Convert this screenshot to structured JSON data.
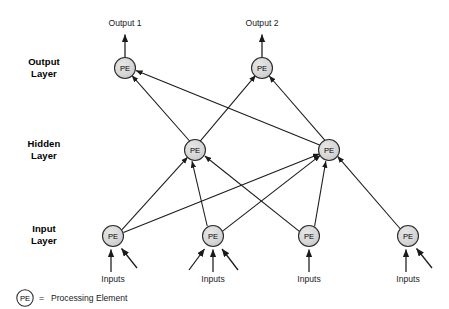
{
  "diagram": {
    "node_label": "PE",
    "colors": {
      "node_fill": "#d4d4d4",
      "node_stroke": "#2b2b2b",
      "edge": "#1a1a1a",
      "text": "#000000",
      "background": "#ffffff"
    }
  },
  "layer_labels": [
    {
      "id": "output",
      "line1": "Output",
      "line2": "Layer"
    },
    {
      "id": "hidden",
      "line1": "Hidden",
      "line2": "Layer"
    },
    {
      "id": "input",
      "line1": "Input",
      "line2": "Layer"
    }
  ],
  "outputs": [
    {
      "id": "output-1",
      "label": "Output 1"
    },
    {
      "id": "output-2",
      "label": "Output 2"
    }
  ],
  "input_labels": [
    {
      "id": "inputs-1",
      "label": "Inputs"
    },
    {
      "id": "inputs-2",
      "label": "Inputs"
    },
    {
      "id": "inputs-3",
      "label": "Inputs"
    },
    {
      "id": "inputs-4",
      "label": "Inputs"
    }
  ],
  "nodes": {
    "output_layer": [
      {
        "id": "out-pe-1",
        "label": "PE",
        "cx": 125,
        "cy": 68,
        "r": 10.5
      },
      {
        "id": "out-pe-2",
        "label": "PE",
        "cx": 262,
        "cy": 68,
        "r": 10.5
      }
    ],
    "hidden_layer": [
      {
        "id": "hid-pe-1",
        "label": "PE",
        "cx": 195,
        "cy": 150,
        "r": 10.5
      },
      {
        "id": "hid-pe-2",
        "label": "PE",
        "cx": 329,
        "cy": 150,
        "r": 10.5
      }
    ],
    "input_layer": [
      {
        "id": "in-pe-1",
        "label": "PE",
        "cx": 113,
        "cy": 236,
        "r": 10.5
      },
      {
        "id": "in-pe-2",
        "label": "PE",
        "cx": 213,
        "cy": 236,
        "r": 10.5
      },
      {
        "id": "in-pe-3",
        "label": "PE",
        "cx": 309,
        "cy": 236,
        "r": 10.5
      },
      {
        "id": "in-pe-4",
        "label": "PE",
        "cx": 408,
        "cy": 236,
        "r": 10.5
      }
    ]
  },
  "edges": {
    "hidden_to_output": [
      {
        "from": "hid-pe-1",
        "to": "out-pe-1"
      },
      {
        "from": "hid-pe-1",
        "to": "out-pe-2"
      },
      {
        "from": "hid-pe-2",
        "to": "out-pe-1"
      },
      {
        "from": "hid-pe-2",
        "to": "out-pe-2"
      }
    ],
    "input_to_hidden": [
      {
        "from": "in-pe-1",
        "to": "hid-pe-1"
      },
      {
        "from": "in-pe-1",
        "to": "hid-pe-2"
      },
      {
        "from": "in-pe-2",
        "to": "hid-pe-1"
      },
      {
        "from": "in-pe-2",
        "to": "hid-pe-2"
      },
      {
        "from": "in-pe-3",
        "to": "hid-pe-1"
      },
      {
        "from": "in-pe-3",
        "to": "hid-pe-2"
      },
      {
        "from": "in-pe-4",
        "to": "hid-pe-2"
      }
    ],
    "output_arrows": [
      {
        "from": "out-pe-1",
        "to": "output-1"
      },
      {
        "from": "out-pe-2",
        "to": "output-2"
      }
    ],
    "input_arrow_counts": [
      2,
      3,
      1,
      2
    ]
  },
  "legend": {
    "symbol_label": "PE",
    "equals": "=",
    "description": "Processing Element"
  }
}
